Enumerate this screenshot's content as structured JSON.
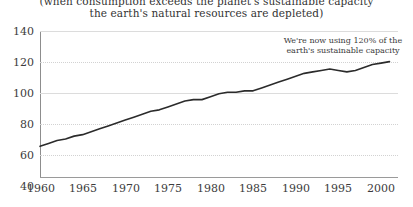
{
  "chart_data": {
    "type": "line",
    "title": "(when consumption exceeds the planet's sustainable capacity the earth's natural resources are depleted)",
    "title_lines": [
      "(when consumption exceeds the planet's sustainable capacity",
      "the earth's natural resources are depleted)"
    ],
    "xlabel": "",
    "ylabel": "",
    "xlim": [
      1960,
      2002
    ],
    "ylim": [
      40,
      140
    ],
    "grid": true,
    "legend": "none",
    "y_ticks": [
      140,
      120,
      100,
      80,
      60,
      40
    ],
    "x_ticks": [
      1960,
      1965,
      1970,
      1975,
      1980,
      1985,
      1990,
      1995,
      2000
    ],
    "annotations": [
      {
        "name": "footprint-callout",
        "lines": [
          "We're now using 120% of the",
          "earth's sustainable capacity"
        ],
        "x": 1996,
        "y": 131
      }
    ],
    "series": [
      {
        "name": "Humanity's ecological footprint (% of earth's sustainable capacity)",
        "color": "#2b2b2b",
        "x": [
          1960,
          1961,
          1962,
          1963,
          1964,
          1965,
          1966,
          1967,
          1968,
          1969,
          1970,
          1971,
          1972,
          1973,
          1974,
          1975,
          1976,
          1977,
          1978,
          1979,
          1980,
          1981,
          1982,
          1983,
          1984,
          1985,
          1986,
          1987,
          1988,
          1989,
          1990,
          1991,
          1992,
          1993,
          1994,
          1995,
          1996,
          1997,
          1998,
          1999,
          2000,
          2001
        ],
        "values": [
          61,
          63,
          65,
          66,
          68,
          69,
          71,
          73,
          75,
          77,
          79,
          81,
          83,
          85,
          86,
          88,
          90,
          92,
          93,
          93,
          95,
          97,
          98,
          98,
          99,
          99,
          101,
          103,
          105,
          107,
          109,
          111,
          112,
          113,
          114,
          113,
          112,
          113,
          115,
          117,
          118,
          119
        ]
      }
    ],
    "colors": {
      "line": "#2b2b2b",
      "gridline": "#d2d2d2",
      "axis": "#9a9a9a",
      "text": "#3a3a3a",
      "background": "#ffffff"
    }
  }
}
